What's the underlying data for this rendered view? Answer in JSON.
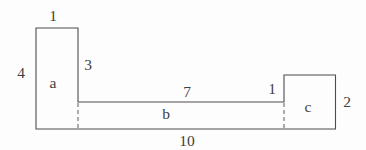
{
  "diagram": {
    "description_labels": {
      "a_width_top": "1",
      "a_height_left": "4",
      "a_right_side": "3",
      "region_a": "a",
      "strip_top_length": "7",
      "c_width_top": "1",
      "c_height_right": "2",
      "region_c": "c",
      "region_b": "b",
      "total_bottom_length": "10"
    },
    "colors": {
      "line": "#4d4d4d",
      "background": "#fdfdfd",
      "text": "#3f3f3f"
    }
  }
}
